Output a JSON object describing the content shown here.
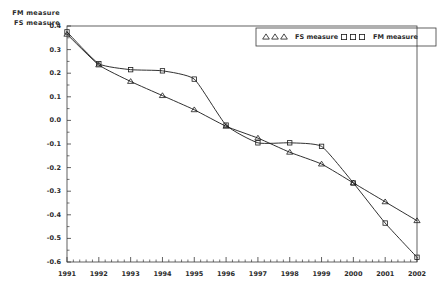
{
  "chart_data": {
    "type": "line",
    "title": "",
    "xlabel": "",
    "ylabel": "FM measure / FS measure",
    "ylabel_lines": [
      "FM measure",
      "FS measure"
    ],
    "x": [
      1991,
      1992,
      1993,
      1994,
      1995,
      1996,
      1997,
      1998,
      1999,
      2000,
      2001,
      2002
    ],
    "xtick_labels": [
      "1991",
      "1992",
      "1993",
      "1994",
      "1995",
      "1996",
      "1997",
      "1998",
      "1999",
      "2000",
      "2001",
      "2002"
    ],
    "ytick_labels": [
      "0.4",
      "0.3",
      "0.2",
      "0.1",
      "0.0",
      "-0.1",
      "-0.2",
      "-0.3",
      "-0.4",
      "-0.5",
      "-0.6"
    ],
    "ytick_values": [
      0.4,
      0.3,
      0.2,
      0.1,
      0.0,
      -0.1,
      -0.2,
      -0.3,
      -0.4,
      -0.5,
      -0.6
    ],
    "xlim": [
      1991,
      2002
    ],
    "ylim": [
      -0.6,
      0.4
    ],
    "grid": false,
    "legend_position": "top-right",
    "series": [
      {
        "name": "FS measure",
        "marker": "triangle",
        "color": "#1a1a1a",
        "values": [
          0.365,
          0.235,
          0.165,
          0.105,
          0.045,
          -0.025,
          -0.075,
          -0.135,
          -0.185,
          -0.265,
          -0.345,
          -0.425
        ]
      },
      {
        "name": "FM measure",
        "marker": "square",
        "color": "#1a1a1a",
        "values": [
          0.375,
          0.24,
          0.215,
          0.21,
          0.175,
          -0.02,
          -0.095,
          -0.095,
          -0.11,
          -0.265,
          -0.435,
          -0.58
        ]
      }
    ]
  },
  "legend": {
    "entries": [
      {
        "label": "FS measure",
        "marker": "triangle"
      },
      {
        "label": "FM measure",
        "marker": "square"
      }
    ]
  }
}
